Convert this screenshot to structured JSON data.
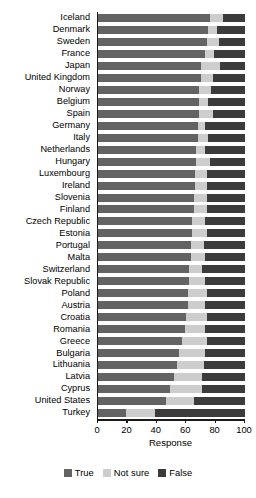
{
  "chart_data": {
    "type": "bar",
    "orientation": "horizontal",
    "stacked": true,
    "percent": true,
    "title": "",
    "xlabel": "Response",
    "ylabel": "",
    "xlim": [
      0,
      100
    ],
    "xticks": [
      0,
      20,
      40,
      60,
      80,
      100
    ],
    "xticklabels": [
      "0",
      "20",
      "40",
      "60",
      "80",
      "100"
    ],
    "grid": false,
    "legend_position": "bottom",
    "categories": [
      "Iceland",
      "Denmark",
      "Sweden",
      "France",
      "Japan",
      "United Kingdom",
      "Norway",
      "Belgium",
      "Spain",
      "Germany",
      "Italy",
      "Netherlands",
      "Hungary",
      "Luxembourg",
      "Ireland",
      "Slovenia",
      "Finland",
      "Czech Republic",
      "Estonia",
      "Portugal",
      "Malta",
      "Switzerland",
      "Slovak Republic",
      "Poland",
      "Austria",
      "Croatia",
      "Romania",
      "Greece",
      "Bulgaria",
      "Lithuania",
      "Latvia",
      "Cyprus",
      "United States",
      "Turkey"
    ],
    "series": [
      {
        "name": "True",
        "color": "#636363",
        "values": [
          76,
          75,
          74,
          73,
          70,
          70,
          69,
          69,
          69,
          68,
          68,
          67,
          67,
          66,
          66,
          65,
          65,
          64,
          64,
          63,
          63,
          62,
          62,
          61,
          61,
          60,
          59,
          57,
          55,
          54,
          52,
          49,
          46,
          19
        ]
      },
      {
        "name": "Not sure",
        "color": "#cdcdcd",
        "values": [
          9,
          6,
          8,
          6,
          13,
          8,
          8,
          6,
          9,
          5,
          7,
          6,
          9,
          8,
          8,
          9,
          9,
          9,
          10,
          9,
          10,
          9,
          11,
          13,
          12,
          14,
          14,
          17,
          18,
          18,
          19,
          22,
          19,
          20
        ]
      },
      {
        "name": "False",
        "color": "#3b3b3b",
        "values": [
          15,
          19,
          18,
          21,
          17,
          22,
          23,
          25,
          22,
          27,
          25,
          27,
          24,
          26,
          26,
          26,
          26,
          27,
          26,
          28,
          27,
          29,
          27,
          26,
          27,
          26,
          27,
          26,
          27,
          28,
          29,
          29,
          35,
          61
        ]
      }
    ]
  },
  "legend": {
    "items": [
      {
        "label": "True",
        "color": "#636363"
      },
      {
        "label": "Not sure",
        "color": "#cdcdcd"
      },
      {
        "label": "False",
        "color": "#3b3b3b"
      }
    ]
  },
  "caption": ""
}
